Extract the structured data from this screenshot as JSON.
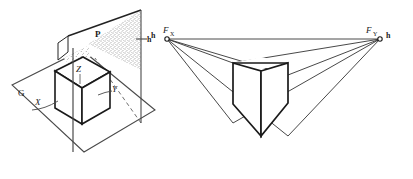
{
  "figure": {
    "stroke_color": "#222222",
    "thin_stroke_color": "#4a4a4a",
    "stipple_color": "#3a3a3a",
    "background": "#ffffff"
  },
  "left_diagram": {
    "name": "spatial-setup",
    "labels": {
      "ground_plane": "G",
      "picture_plane": "P",
      "axis_x": "X",
      "axis_y": "Y",
      "axis_z": "Z",
      "horizon": "h"
    }
  },
  "right_diagram": {
    "name": "perspective-projection",
    "labels": {
      "horizon_left": "h",
      "vanishing_point_x": "F",
      "vanishing_point_x_sub": "X",
      "vanishing_point_y": "F",
      "vanishing_point_y_sub": "Y",
      "horizon_right": "h"
    }
  }
}
